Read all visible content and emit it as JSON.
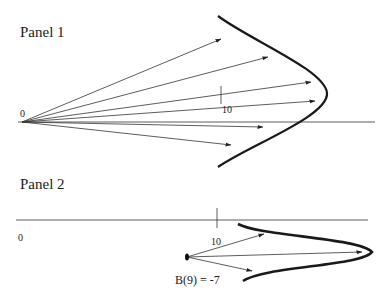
{
  "panel1": {
    "title": "Panel 1",
    "origin_label": "0",
    "tick_label": "10",
    "axis": {
      "y": 122,
      "x1": 18,
      "x2": 375
    },
    "origin": {
      "x": 22,
      "y": 122
    },
    "tick": {
      "x": 221,
      "y1": 86,
      "y2": 104
    },
    "arrow_ends": [
      {
        "x": 221,
        "y": 39
      },
      {
        "x": 268,
        "y": 57
      },
      {
        "x": 311,
        "y": 82
      },
      {
        "x": 315,
        "y": 101
      },
      {
        "x": 263,
        "y": 127
      },
      {
        "x": 231,
        "y": 145
      }
    ],
    "curve": "M 218 16 C 250 40, 325 70, 327 93 C 329 116, 250 145, 218 167"
  },
  "panel2": {
    "title": "Panel 2",
    "origin_label": "0",
    "tick_label": "10",
    "annotation": "B(9) = -7",
    "axis": {
      "y": 220,
      "x1": 16,
      "x2": 368
    },
    "tick": {
      "x": 217,
      "y1": 208,
      "y2": 228
    },
    "start_point": {
      "x": 187,
      "y": 257
    },
    "arrow_ends": [
      {
        "x": 264,
        "y": 234
      },
      {
        "x": 362,
        "y": 252
      },
      {
        "x": 252,
        "y": 271
      }
    ],
    "curve": "M 238 224 C 260 236, 360 238, 372 252 C 362 266, 265 266, 243 281"
  },
  "colors": {
    "line": "#333333",
    "curve": "#1a1a1a",
    "background": "#ffffff"
  }
}
